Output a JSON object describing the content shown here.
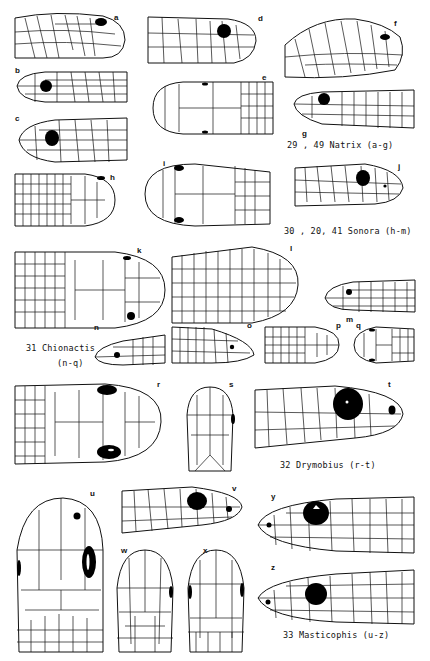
{
  "plate": {
    "groups": [
      {
        "id": "natrix",
        "caption": "29 , 49 Natrix  (a-g)",
        "figures": [
          "a",
          "b",
          "c",
          "d",
          "e",
          "f",
          "g"
        ]
      },
      {
        "id": "sonora",
        "caption": "30 , 20, 41 Sonora  (h-m)",
        "figures": [
          "h",
          "i",
          "j",
          "k",
          "l",
          "m"
        ]
      },
      {
        "id": "chionactis",
        "caption_line1": "31  Chionactis",
        "caption_line2": "(n-q)",
        "figures": [
          "n",
          "o",
          "p",
          "q"
        ]
      },
      {
        "id": "drymobius",
        "caption": "32  Drymobius  (r-t)",
        "figures": [
          "r",
          "s",
          "t"
        ]
      },
      {
        "id": "masticophis",
        "caption": "33 Masticophis  (u-z)",
        "figures": [
          "u",
          "v",
          "w",
          "x",
          "y",
          "z"
        ]
      }
    ],
    "labels": {
      "a": "a",
      "b": "b",
      "c": "c",
      "d": "d",
      "e": "e",
      "f": "f",
      "g": "g",
      "h": "h",
      "i": "i",
      "j": "j",
      "k": "k",
      "l": "l",
      "m": "m",
      "n": "n",
      "o": "o",
      "p": "p",
      "q": "q",
      "r": "r",
      "s": "s",
      "t": "t",
      "u": "u",
      "v": "v",
      "w": "w",
      "x": "x",
      "y": "y",
      "z": "z"
    },
    "views": {
      "a": "lateral",
      "b": "lateral",
      "c": "lateral",
      "d": "lateral",
      "e": "dorsal",
      "f": "lateral",
      "g": "lateral",
      "h": "dorsal",
      "i": "dorsal",
      "j": "lateral",
      "k": "dorsal",
      "l": "dorsal",
      "m": "lateral",
      "n": "lateral",
      "o": "lateral",
      "p": "dorsal",
      "q": "dorsal",
      "r": "dorsal",
      "s": "ventral",
      "t": "lateral",
      "u": "dorsal",
      "v": "lateral",
      "w": "ventral",
      "x": "ventral",
      "y": "lateral",
      "z": "lateral"
    }
  }
}
